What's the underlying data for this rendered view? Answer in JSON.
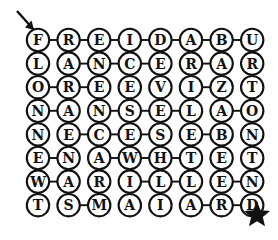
{
  "puzzle": {
    "title": "Word path letter grid puzzle",
    "rows": 8,
    "cols": 8,
    "ink_color": "#111111",
    "node_fill": "#ffffff",
    "grid": [
      [
        "F",
        "R",
        "E",
        "I",
        "D",
        "A",
        "B",
        "U"
      ],
      [
        "L",
        "A",
        "N",
        "C",
        "E",
        "R",
        "A",
        "R"
      ],
      [
        "O",
        "R",
        "E",
        "E",
        "V",
        "I",
        "Z",
        "T"
      ],
      [
        "N",
        "A",
        "N",
        "S",
        "E",
        "L",
        "A",
        "O"
      ],
      [
        "N",
        "E",
        "C",
        "E",
        "S",
        "E",
        "B",
        "N"
      ],
      [
        "E",
        "N",
        "A",
        "W",
        "H",
        "T",
        "E",
        "T"
      ],
      [
        "W",
        "A",
        "R",
        "I",
        "L",
        "L",
        "E",
        "N"
      ],
      [
        "T",
        "S",
        "M",
        "A",
        "I",
        "A",
        "R",
        "D"
      ]
    ],
    "edges": [
      {
        "type": "h",
        "r": 0,
        "c": 0
      },
      {
        "type": "h",
        "r": 0,
        "c": 1
      },
      {
        "type": "h",
        "r": 0,
        "c": 2
      },
      {
        "type": "h",
        "r": 0,
        "c": 3
      },
      {
        "type": "h",
        "r": 0,
        "c": 4
      },
      {
        "type": "h",
        "r": 0,
        "c": 5
      },
      {
        "type": "h",
        "r": 0,
        "c": 6
      },
      {
        "type": "h",
        "r": 1,
        "c": 1
      },
      {
        "type": "h",
        "r": 1,
        "c": 2
      },
      {
        "type": "h",
        "r": 1,
        "c": 3
      },
      {
        "type": "h",
        "r": 1,
        "c": 5
      },
      {
        "type": "h",
        "r": 2,
        "c": 0
      },
      {
        "type": "h",
        "r": 2,
        "c": 1
      },
      {
        "type": "h",
        "r": 2,
        "c": 5
      },
      {
        "type": "h",
        "r": 3,
        "c": 0
      },
      {
        "type": "h",
        "r": 3,
        "c": 2
      },
      {
        "type": "h",
        "r": 3,
        "c": 3
      },
      {
        "type": "h",
        "r": 3,
        "c": 4
      },
      {
        "type": "h",
        "r": 3,
        "c": 6
      },
      {
        "type": "h",
        "r": 4,
        "c": 1
      },
      {
        "type": "h",
        "r": 4,
        "c": 2
      },
      {
        "type": "h",
        "r": 4,
        "c": 3
      },
      {
        "type": "h",
        "r": 4,
        "c": 5
      },
      {
        "type": "h",
        "r": 5,
        "c": 0
      },
      {
        "type": "h",
        "r": 5,
        "c": 2
      },
      {
        "type": "h",
        "r": 5,
        "c": 3
      },
      {
        "type": "h",
        "r": 5,
        "c": 4
      },
      {
        "type": "h",
        "r": 6,
        "c": 0
      },
      {
        "type": "h",
        "r": 6,
        "c": 3
      },
      {
        "type": "h",
        "r": 6,
        "c": 4
      },
      {
        "type": "h",
        "r": 6,
        "c": 6
      },
      {
        "type": "h",
        "r": 7,
        "c": 1
      },
      {
        "type": "h",
        "r": 7,
        "c": 5
      },
      {
        "type": "h",
        "r": 7,
        "c": 6
      },
      {
        "type": "v",
        "r": 0,
        "c": 0
      },
      {
        "type": "v",
        "r": 1,
        "c": 0
      },
      {
        "type": "v",
        "r": 2,
        "c": 0
      },
      {
        "type": "v",
        "r": 3,
        "c": 0
      },
      {
        "type": "v",
        "r": 4,
        "c": 0
      },
      {
        "type": "v",
        "r": 5,
        "c": 0
      },
      {
        "type": "v",
        "r": 6,
        "c": 0
      },
      {
        "type": "v",
        "r": 0,
        "c": 1
      },
      {
        "type": "v",
        "r": 1,
        "c": 1
      },
      {
        "type": "v",
        "r": 2,
        "c": 1
      },
      {
        "type": "v",
        "r": 3,
        "c": 1
      },
      {
        "type": "v",
        "r": 5,
        "c": 1
      },
      {
        "type": "v",
        "r": 6,
        "c": 1
      },
      {
        "type": "v",
        "r": 1,
        "c": 2
      },
      {
        "type": "v",
        "r": 2,
        "c": 2
      },
      {
        "type": "v",
        "r": 3,
        "c": 2
      },
      {
        "type": "v",
        "r": 5,
        "c": 2
      },
      {
        "type": "v",
        "r": 6,
        "c": 2
      },
      {
        "type": "v",
        "r": 0,
        "c": 3
      },
      {
        "type": "v",
        "r": 1,
        "c": 3
      },
      {
        "type": "v",
        "r": 2,
        "c": 3
      },
      {
        "type": "v",
        "r": 3,
        "c": 3
      },
      {
        "type": "v",
        "r": 4,
        "c": 3
      },
      {
        "type": "v",
        "r": 5,
        "c": 3
      },
      {
        "type": "v",
        "r": 1,
        "c": 4
      },
      {
        "type": "v",
        "r": 2,
        "c": 4
      },
      {
        "type": "v",
        "r": 3,
        "c": 4
      },
      {
        "type": "v",
        "r": 0,
        "c": 5
      },
      {
        "type": "v",
        "r": 2,
        "c": 5
      },
      {
        "type": "v",
        "r": 3,
        "c": 5
      },
      {
        "type": "v",
        "r": 4,
        "c": 5
      },
      {
        "type": "v",
        "r": 6,
        "c": 5
      },
      {
        "type": "v",
        "r": 2,
        "c": 6
      },
      {
        "type": "v",
        "r": 3,
        "c": 6
      },
      {
        "type": "v",
        "r": 4,
        "c": 6
      },
      {
        "type": "v",
        "r": 5,
        "c": 6
      },
      {
        "type": "v",
        "r": 0,
        "c": 7
      },
      {
        "type": "v",
        "r": 1,
        "c": 7
      },
      {
        "type": "v",
        "r": 3,
        "c": 7
      },
      {
        "type": "v",
        "r": 4,
        "c": 7
      },
      {
        "type": "v",
        "r": 5,
        "c": 7
      }
    ]
  },
  "markers": {
    "start_arrow": {
      "name": "start-arrow",
      "label": "↘"
    },
    "end_star": {
      "name": "end-star",
      "label": "★"
    }
  }
}
